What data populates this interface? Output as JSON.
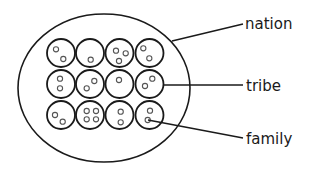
{
  "diagram": {
    "title": "",
    "outer": {
      "name": "nation",
      "cx": 104,
      "cy": 88,
      "rx": 86,
      "ry": 74
    },
    "grid": {
      "radius": 14,
      "member_radius": 2.6,
      "cells": [
        {
          "cx": 61,
          "cy": 53,
          "members": [
            [
              56,
              49.3
            ],
            [
              63.3,
              59
            ]
          ]
        },
        {
          "cx": 90,
          "cy": 53,
          "members": [
            [
              90.7,
              59.7
            ]
          ]
        },
        {
          "cx": 119.5,
          "cy": 53,
          "members": [
            [
              116,
              50.7
            ],
            [
              125.7,
              53.3
            ],
            [
              119,
              61
            ]
          ]
        },
        {
          "cx": 149.5,
          "cy": 53,
          "members": [
            [
              143.3,
              48.3
            ],
            [
              149.3,
              58.3
            ]
          ]
        },
        {
          "cx": 61,
          "cy": 84,
          "members": [
            [
              60,
              78.7
            ],
            [
              60,
              88.3
            ]
          ]
        },
        {
          "cx": 90,
          "cy": 84,
          "members": [
            [
              94.3,
              81
            ],
            [
              86.7,
              88.3
            ]
          ]
        },
        {
          "cx": 119.5,
          "cy": 84,
          "members": [
            [
              119,
              80
            ]
          ]
        },
        {
          "cx": 149.5,
          "cy": 84,
          "members": [
            [
              152.3,
              78.7
            ],
            [
              145,
              86
            ]
          ]
        },
        {
          "cx": 61,
          "cy": 115,
          "members": [
            [
              55,
              115
            ],
            [
              62.7,
              121.7
            ]
          ]
        },
        {
          "cx": 90,
          "cy": 115,
          "members": [
            [
              86.7,
              111
            ],
            [
              96,
              111
            ],
            [
              86.7,
              119.3
            ],
            [
              96,
              119.3
            ]
          ]
        },
        {
          "cx": 119.5,
          "cy": 115,
          "members": [
            [
              120.7,
              111.7
            ],
            [
              120.7,
              122.3
            ]
          ]
        },
        {
          "cx": 149.5,
          "cy": 115,
          "members": [
            [
              150,
              110.7
            ],
            [
              147.7,
              120
            ]
          ]
        }
      ]
    },
    "labels": [
      {
        "text": "nation",
        "x": 245,
        "y": 29,
        "line": [
          172,
          41,
          243,
          24
        ]
      },
      {
        "text": "tribe",
        "x": 246,
        "y": 91,
        "line": [
          163,
          85,
          243,
          85
        ]
      },
      {
        "text": "family",
        "x": 246,
        "y": 144,
        "line": [
          148,
          120,
          243,
          138
        ]
      }
    ]
  }
}
